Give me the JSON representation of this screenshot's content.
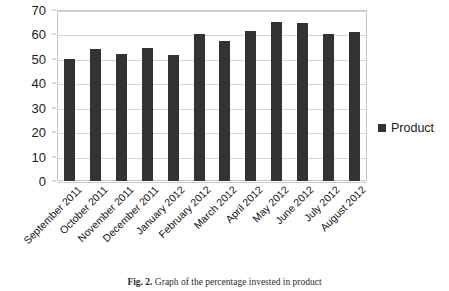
{
  "figure": {
    "caption_label": "Fig. 2.",
    "caption_text": "Graph of the percentage invested in product"
  },
  "legend": {
    "position": "right",
    "entries": [
      {
        "name": "Product",
        "color": "#333333"
      }
    ]
  },
  "chart_data": {
    "type": "bar",
    "title": "",
    "subtitle": "",
    "xlabel": "",
    "ylabel": "",
    "ylim": [
      0,
      70
    ],
    "ytick_step": 10,
    "yticks": [
      0,
      10,
      20,
      30,
      40,
      50,
      60,
      70
    ],
    "ytick_labels": [
      "0",
      "10",
      "20",
      "30",
      "40",
      "50",
      "60",
      "70"
    ],
    "grid": true,
    "grid_axis": "y",
    "legend_position": "right",
    "bar_color": "#333333",
    "categories": [
      "September 2011",
      "October 2011",
      "November 2011",
      "December 2011",
      "January 2012",
      "February 2012",
      "March 2012",
      "April 2012",
      "May 2012",
      "June 2012",
      "July 2012",
      "August 2012"
    ],
    "series": [
      {
        "name": "Product",
        "color": "#333333",
        "values": [
          50,
          54,
          52,
          54.5,
          51.5,
          60,
          57.5,
          61.5,
          65,
          64.5,
          60,
          61
        ]
      }
    ]
  }
}
